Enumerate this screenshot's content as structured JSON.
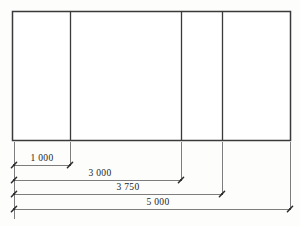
{
  "drawing": {
    "title": "Elevation with cumulative dimensions",
    "units": "mm",
    "background_color": "#fdfdfb",
    "line_color": "#3a3a3a",
    "dimension_line_color": "#6e6e6e",
    "text_color": "#1d1d1d",
    "elevation": {
      "name": "panel-elevation",
      "outline": {
        "x": 12,
        "y": 11,
        "width": 278,
        "height": 129
      },
      "dividers": [
        {
          "name": "divider-1",
          "x": 70,
          "position_value": "1 000"
        },
        {
          "name": "divider-2",
          "x": 181,
          "position_value": "3 000"
        },
        {
          "name": "divider-3",
          "x": 222,
          "position_value": "3 750"
        }
      ],
      "panels": [
        {
          "name": "panel-1",
          "x": 12,
          "width": 58
        },
        {
          "name": "panel-2",
          "x": 70,
          "width": 111
        },
        {
          "name": "panel-3",
          "x": 181,
          "width": 41
        },
        {
          "name": "panel-4",
          "x": 222,
          "width": 68
        }
      ]
    },
    "dimensions": [
      {
        "name": "dimension-1000",
        "label": "1 000",
        "value": 1000,
        "start_x": 14,
        "end_x": 70,
        "line_y": 165,
        "extension_top": 142,
        "label_x": 42,
        "label_y": 161
      },
      {
        "name": "dimension-3000",
        "label": "3 000",
        "value": 3000,
        "start_x": 14,
        "end_x": 181,
        "line_y": 180,
        "extension_top": 142,
        "label_x": 100,
        "label_y": 176
      },
      {
        "name": "dimension-3750",
        "label": "3 750",
        "value": 3750,
        "start_x": 14,
        "end_x": 222,
        "line_y": 194,
        "extension_top": 142,
        "label_x": 128,
        "label_y": 190
      },
      {
        "name": "dimension-5000",
        "label": "5 000",
        "value": 5000,
        "start_x": 14,
        "end_x": 290,
        "line_y": 209,
        "extension_top": 142,
        "label_x": 158,
        "label_y": 205
      }
    ],
    "left_extension": {
      "x": 14,
      "top": 142,
      "bottom": 219
    }
  }
}
